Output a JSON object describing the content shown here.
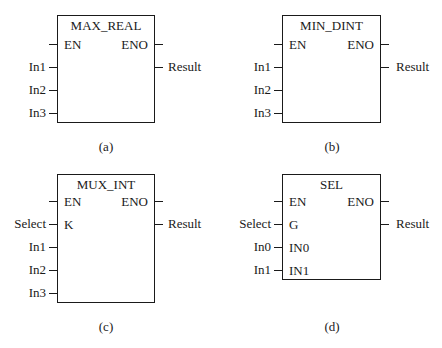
{
  "figure": {
    "blocks": [
      {
        "id": "a",
        "title": "MAX_REAL",
        "caption": "(a)",
        "left_pins": [
          {
            "internal": "EN",
            "external": ""
          },
          {
            "internal": "",
            "external": "In1"
          },
          {
            "internal": "",
            "external": "In2"
          },
          {
            "internal": "",
            "external": "In3"
          }
        ],
        "right_pins": [
          {
            "internal": "ENO",
            "external": ""
          },
          {
            "internal": "",
            "external": "Result"
          }
        ]
      },
      {
        "id": "b",
        "title": "MIN_DINT",
        "caption": "(b)",
        "left_pins": [
          {
            "internal": "EN",
            "external": ""
          },
          {
            "internal": "",
            "external": "In1"
          },
          {
            "internal": "",
            "external": "In2"
          },
          {
            "internal": "",
            "external": "In3"
          }
        ],
        "right_pins": [
          {
            "internal": "ENO",
            "external": ""
          },
          {
            "internal": "",
            "external": "Result"
          }
        ]
      },
      {
        "id": "c",
        "title": "MUX_INT",
        "caption": "(c)",
        "left_pins": [
          {
            "internal": "EN",
            "external": ""
          },
          {
            "internal": "K",
            "external": "Select"
          },
          {
            "internal": "",
            "external": "In1"
          },
          {
            "internal": "",
            "external": "In2"
          },
          {
            "internal": "",
            "external": "In3"
          }
        ],
        "right_pins": [
          {
            "internal": "ENO",
            "external": ""
          },
          {
            "internal": "",
            "external": "Result"
          }
        ]
      },
      {
        "id": "d",
        "title": "SEL",
        "caption": "(d)",
        "left_pins": [
          {
            "internal": "EN",
            "external": ""
          },
          {
            "internal": "G",
            "external": "Select"
          },
          {
            "internal": "IN0",
            "external": "In0"
          },
          {
            "internal": "IN1",
            "external": "In1"
          }
        ],
        "right_pins": [
          {
            "internal": "ENO",
            "external": ""
          },
          {
            "internal": "",
            "external": "Result"
          }
        ]
      }
    ]
  }
}
